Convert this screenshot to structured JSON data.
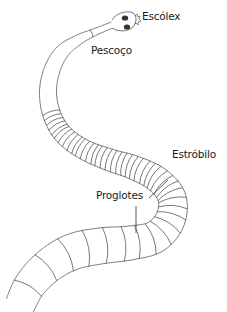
{
  "diagram": {
    "labels": [
      {
        "id": "escolex",
        "text": "Escólex"
      },
      {
        "id": "pescoco",
        "text": "Pescoço"
      },
      {
        "id": "estrobilo",
        "text": "Estróbilo"
      },
      {
        "id": "proglotes",
        "text": "Proglotes"
      }
    ],
    "colors": {
      "line": "#555555",
      "text": "#1a1a1a",
      "sucker": "#333333",
      "background": "#ffffff"
    }
  }
}
